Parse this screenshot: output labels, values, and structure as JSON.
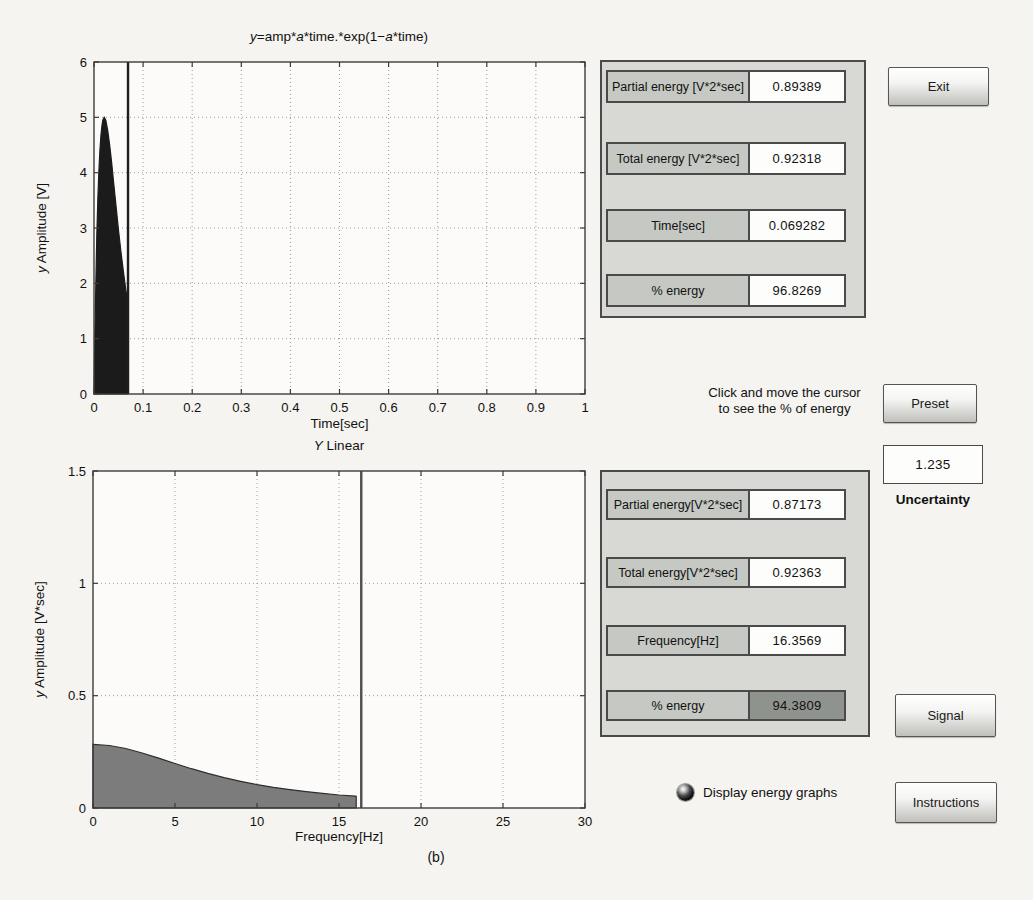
{
  "chart_data": [
    {
      "type": "area",
      "title": "y=amp*a*time.*exp(1-a*time)",
      "title_segments": [
        {
          "t": "y",
          "i": 1
        },
        {
          "t": "=amp*"
        },
        {
          "t": "a",
          "i": 1
        },
        {
          "t": "*time.*exp(1−"
        },
        {
          "t": "a",
          "i": 1
        },
        {
          "t": "*time)"
        }
      ],
      "xlabel": "Time[sec]",
      "ylabel_segments": [
        {
          "t": "y",
          "i": 1
        },
        {
          "t": " Amplitude [V]"
        }
      ],
      "xlim": [
        0,
        1
      ],
      "ylim": [
        0,
        6
      ],
      "grid": true,
      "xticks": [
        0,
        0.1,
        0.2,
        0.3,
        0.4,
        0.5,
        0.6,
        0.7,
        0.8,
        0.9,
        1
      ],
      "xtick_labels": [
        "0",
        "0.1",
        "0.2",
        "0.3",
        "0.4",
        "0.5",
        "0.6",
        "0.7",
        "0.8",
        "0.9",
        "1"
      ],
      "yticks": [
        0,
        1,
        2,
        3,
        4,
        5,
        6
      ],
      "ytick_labels": [
        "0",
        "1",
        "2",
        "3",
        "4",
        "5",
        "6"
      ],
      "x": [
        0,
        0.002,
        0.004,
        0.006,
        0.008,
        0.01,
        0.012,
        0.014,
        0.016,
        0.018,
        0.0208,
        0.024,
        0.028,
        0.032,
        0.036,
        0.04,
        0.045,
        0.05,
        0.055,
        0.06,
        0.065,
        0.069282
      ],
      "y": [
        0,
        1.185,
        2.154,
        2.935,
        3.555,
        4.037,
        4.401,
        4.664,
        4.843,
        4.949,
        5.0,
        4.948,
        4.764,
        4.494,
        4.172,
        3.826,
        3.386,
        2.959,
        2.561,
        2.197,
        1.872,
        1.626
      ],
      "fill_color": "#1b1b1b",
      "stroke_color": "#1b1b1b",
      "cursor_x": 0.069282,
      "cursor_color": "#1e1e1e"
    },
    {
      "type": "area",
      "title": "Y Linear",
      "title_segments": [
        {
          "t": "Y",
          "i": 1
        },
        {
          "t": " Linear"
        }
      ],
      "xlabel": "Frequency[Hz]",
      "ylabel_segments": [
        {
          "t": "y",
          "i": 1
        },
        {
          "t": " Amplitude [V*sec]"
        }
      ],
      "xlim": [
        0,
        30
      ],
      "ylim": [
        0,
        1.5
      ],
      "grid": true,
      "xticks": [
        0,
        5,
        10,
        15,
        20,
        25,
        30
      ],
      "xtick_labels": [
        "0",
        "5",
        "10",
        "15",
        "20",
        "25",
        "30"
      ],
      "yticks": [
        0,
        0.5,
        1,
        1.5
      ],
      "ytick_labels": [
        "0",
        "0.5",
        "1",
        "1.5"
      ],
      "x": [
        0,
        1,
        2,
        3,
        4,
        5,
        6,
        7,
        8,
        9,
        10,
        11,
        12,
        13,
        14,
        15,
        16,
        16.05
      ],
      "y": [
        0.283,
        0.278,
        0.265,
        0.245,
        0.222,
        0.198,
        0.175,
        0.154,
        0.135,
        0.119,
        0.104,
        0.092,
        0.082,
        0.073,
        0.065,
        0.058,
        0.053,
        0.052
      ],
      "fill_color": "#7c7c7c",
      "stroke_color": "#2e2e2e",
      "cursor_x": 16.3569,
      "cursor_color": "#4e4e4e",
      "caption": "(b)"
    }
  ],
  "panels": {
    "time": {
      "rows": [
        {
          "label": "Partial energy [V*2*sec]",
          "value": "0.89389"
        },
        {
          "label": "Total energy [V*2*sec]",
          "value": "0.92318"
        },
        {
          "label": "Time[sec]",
          "value": "0.069282"
        },
        {
          "label": "% energy",
          "value": "96.8269"
        }
      ]
    },
    "freq": {
      "rows": [
        {
          "label": "Partial energy[V*2*sec]",
          "value": "0.87173"
        },
        {
          "label": "Total energy[V*2*sec]",
          "value": "0.92363"
        },
        {
          "label": "Frequency[Hz]",
          "value": "16.3569"
        },
        {
          "label": "% energy",
          "value": "94.3809",
          "dark": true
        }
      ]
    }
  },
  "hint": {
    "line1": "Click and move the cursor",
    "line2": "to see the % of energy"
  },
  "buttons": {
    "exit": "Exit",
    "preset": "Preset",
    "signal": "Signal",
    "instructions": "Instructions"
  },
  "uncertainty": {
    "value": "1.235",
    "label": "Uncertainty"
  },
  "radio": {
    "label": "Display energy graphs",
    "selected": true
  },
  "colors": {
    "page_bg": "#f5f4f0",
    "panel_bg": "#d8d9d5",
    "label_cell": "#c5c8c3",
    "value_cell": "#fdfdfb",
    "dark_value_cell": "#8f938e",
    "border": "#4a4a4a",
    "time_fill": "#1b1b1b",
    "freq_fill": "#7c7c7c",
    "grid": "#9b9b9b"
  }
}
